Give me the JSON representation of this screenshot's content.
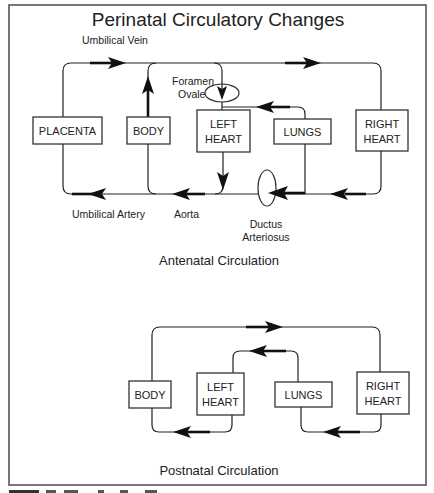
{
  "title": "Perinatal Circulatory Changes",
  "antenatal": {
    "section_label": "Antenatal Circulation",
    "boxes": {
      "placenta": "PLACENTA",
      "body": "BODY",
      "left_heart": [
        "LEFT",
        "HEART"
      ],
      "lungs": "LUNGS",
      "right_heart": [
        "RIGHT",
        "HEART"
      ]
    },
    "vessel_labels": {
      "umbilical_vein": "Umbilical Vein",
      "foramen_ovale": [
        "Foramen",
        "Ovale"
      ],
      "umbilical_artery": "Umbilical Artery",
      "aorta": "Aorta",
      "ductus_arteriosus": [
        "Ductus",
        "Arteriosus"
      ]
    }
  },
  "postnatal": {
    "section_label": "Postnatal Circulation",
    "boxes": {
      "body": "BODY",
      "left_heart": [
        "LEFT",
        "HEART"
      ],
      "lungs": "LUNGS",
      "right_heart": [
        "RIGHT",
        "HEART"
      ]
    }
  },
  "colors": {
    "line": "#222222",
    "frame": "#555555",
    "background": "#ffffff"
  }
}
